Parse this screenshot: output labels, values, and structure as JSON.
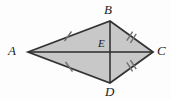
{
  "figure": {
    "kind": "geometry-diagram",
    "shape": "kite",
    "caption": "",
    "colors": {
      "background": "#fdfdfd",
      "fill": "#c8c8c8",
      "stroke": "#333333",
      "diagonal": "#2b2b2b",
      "tick": "#6e6e6e",
      "label": "#1b1b1b"
    },
    "vertices": [
      {
        "name": "A",
        "x": 28,
        "y": 52
      },
      {
        "name": "B",
        "x": 110,
        "y": 21
      },
      {
        "name": "C",
        "x": 153,
        "y": 52
      },
      {
        "name": "D",
        "x": 110,
        "y": 83
      }
    ],
    "interior_points": [
      {
        "name": "E",
        "x": 110,
        "y": 52
      }
    ],
    "diagonals": [
      {
        "name": "AC",
        "from": "A",
        "to": "C"
      },
      {
        "name": "BD",
        "from": "B",
        "to": "D"
      }
    ],
    "sides": [
      {
        "name": "AB",
        "from": "A",
        "to": "B",
        "ticks": 1
      },
      {
        "name": "BC",
        "from": "B",
        "to": "C",
        "ticks": 2
      },
      {
        "name": "CD",
        "from": "C",
        "to": "D",
        "ticks": 2
      },
      {
        "name": "DA",
        "from": "D",
        "to": "A",
        "ticks": 1
      }
    ],
    "labels": {
      "A": "A",
      "B": "B",
      "C": "C",
      "D": "D",
      "E": "E"
    }
  }
}
